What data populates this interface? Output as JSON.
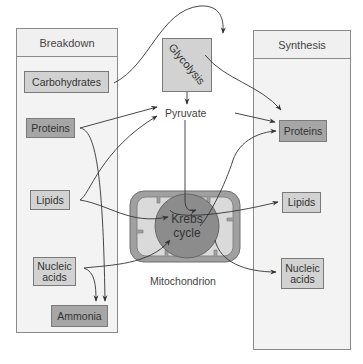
{
  "breakdown": {
    "title": "Breakdown",
    "items": [
      {
        "label": "Carbohydrates",
        "shade": "light"
      },
      {
        "label": "Proteins",
        "shade": "dark"
      },
      {
        "label": "Lipids",
        "shade": "light"
      },
      {
        "label": "Nucleic acids",
        "line1": "Nucleic",
        "line2": "acids",
        "shade": "light"
      },
      {
        "label": "Ammonia",
        "shade": "dark"
      }
    ]
  },
  "synthesis": {
    "title": "Synthesis",
    "items": [
      {
        "label": "Proteins",
        "shade": "dark"
      },
      {
        "label": "Lipids",
        "shade": "light"
      },
      {
        "label": "Nucleic acids",
        "line1": "Nucleic",
        "line2": "acids",
        "shade": "light"
      }
    ]
  },
  "center": {
    "glycolysis": "Glycolysis",
    "pyruvate": "Pyruvate",
    "krebs_line1": "Krebs",
    "krebs_line2": "cycle",
    "mitochondrion": "Mitochondrion"
  },
  "colors": {
    "panel_bg": "#f3f3f3",
    "light_box": "#d2d2d2",
    "dark_box": "#a6a6a6",
    "krebs": "#8c8c8c",
    "mito_outer": "#a0a0a0",
    "mito_inner": "#dadada"
  }
}
